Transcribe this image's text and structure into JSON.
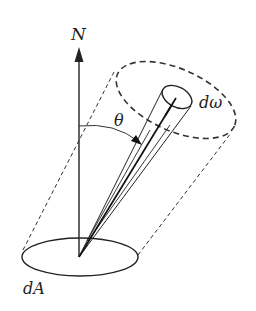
{
  "diagram": {
    "labels": {
      "normal": "N",
      "angle": "θ",
      "solid_angle": "dω",
      "area": "dA"
    },
    "colors": {
      "stroke": "#222222",
      "background": "#ffffff"
    }
  }
}
